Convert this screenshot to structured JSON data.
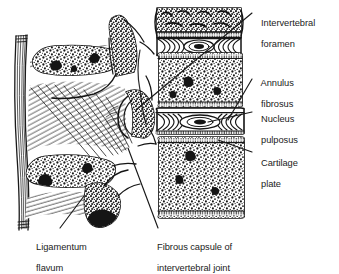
{
  "figure": {
    "style": "black-and-white line engraving with stipple shading",
    "background_color": "#ffffff",
    "ink_color": "#1a1a1a"
  },
  "labels": [
    {
      "id": "intervertebral-foramen",
      "line1": "Intervertebral",
      "line2": "foramen",
      "x": 256,
      "y": 8
    },
    {
      "id": "annulus-fibrosus",
      "line1": "Annulus",
      "line2": "fibrosus",
      "x": 256,
      "y": 68
    },
    {
      "id": "nucleus-pulposus",
      "line1": "Nucleus",
      "line2": "pulposus",
      "x": 256,
      "y": 104
    },
    {
      "id": "cartilage-plate",
      "line1": "Cartilage",
      "line2": "plate",
      "x": 256,
      "y": 148
    },
    {
      "id": "ligamentum-flavum",
      "line1": "Ligamentum",
      "line2": "flavum",
      "x": 31,
      "y": 232
    },
    {
      "id": "fibrous-capsule",
      "line1": "Fibrous capsule of",
      "line2": "intervertebral joint",
      "x": 152,
      "y": 232
    }
  ],
  "bottom_caption": "",
  "structures": [
    {
      "name": "vertebral-body-upper-partial",
      "note": "partial vertebral body cut off at top edge"
    },
    {
      "name": "intervertebral-disc-upper",
      "note": "concentric lamellae with central nucleus"
    },
    {
      "name": "vertebral-body-middle",
      "note": "trabecular stipple texture"
    },
    {
      "name": "intervertebral-disc-lower",
      "note": "lamellae with oval nucleus pulposus"
    },
    {
      "name": "vertebral-body-lower",
      "note": "trabecular stipple texture"
    },
    {
      "name": "spinous-process-upper",
      "note": "stippled elongated oval"
    },
    {
      "name": "spinous-process-lower",
      "note": "stippled elongated oval"
    },
    {
      "name": "supraspinous-ligament",
      "note": "vertical fibre band at far left"
    },
    {
      "name": "ligamentum-flavum-fibres",
      "note": "fine oblique hatching between laminae"
    },
    {
      "name": "superior-articular-process",
      "note": "hook-shaped facet joint"
    },
    {
      "name": "cartilage-end-plate",
      "note": "thin band at vertebral body margins"
    }
  ]
}
